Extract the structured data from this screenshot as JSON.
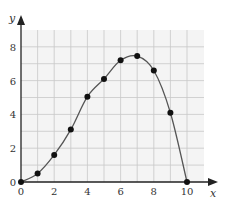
{
  "chart_data": {
    "type": "line",
    "title": "",
    "xlabel": "x",
    "ylabel": "y",
    "xlim": [
      0,
      10.5
    ],
    "ylim": [
      0,
      8.8
    ],
    "grid": true,
    "x_ticks": [
      "0",
      "2",
      "4",
      "6",
      "8",
      "10"
    ],
    "y_ticks": [
      "0",
      "2",
      "4",
      "6",
      "8"
    ],
    "series": [
      {
        "name": "data points",
        "style": "scatter",
        "x": [
          0,
          1,
          2,
          3,
          4,
          5,
          6,
          7,
          8,
          9,
          10
        ],
        "y": [
          0,
          0.5,
          1.6,
          3.1,
          5.05,
          6.1,
          7.2,
          7.45,
          6.6,
          4.1,
          0
        ]
      },
      {
        "name": "fitted curve",
        "style": "smooth line"
      }
    ]
  }
}
